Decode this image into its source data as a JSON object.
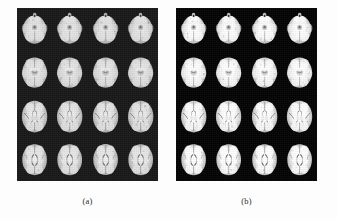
{
  "figure": {
    "type": "image-figure",
    "background_color": "#fdfdfd",
    "panel_background_color": "#151515",
    "panel_count": 2,
    "panels": [
      {
        "id": "a",
        "caption": "(a)",
        "modality": "brain-mri-axial-slices",
        "grid_rows": 4,
        "grid_cols": 4,
        "slice_count": 16,
        "appearance": "softer, lower contrast"
      },
      {
        "id": "b",
        "caption": "(b)",
        "modality": "brain-mri-axial-slices",
        "grid_rows": 4,
        "grid_cols": 4,
        "slice_count": 16,
        "appearance": "sharper, higher contrast"
      }
    ]
  },
  "captions": {
    "panel_a": "(a)",
    "panel_b": "(b)"
  },
  "slice_levels": [
    "inferior-cerebellum-temporal",
    "midbrain-temporal-horn",
    "basal-ganglia-thalamus",
    "lateral-ventricles-superior"
  ],
  "colors": {
    "page": "#fdfdfd",
    "panel": "#151515",
    "tissue_bright": "#f2f2f2",
    "tissue_mid": "#c9c9c9",
    "tissue_dark": "#6a6a6a",
    "caption_text": "#2b2b2b"
  }
}
